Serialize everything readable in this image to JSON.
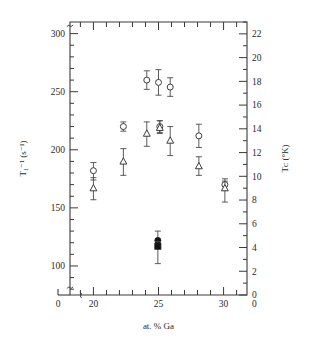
{
  "figure": {
    "background": "#ffffff",
    "ink": "#2a2a2a"
  },
  "chart_data": {
    "type": "scatter",
    "title": "",
    "subtitle": "",
    "xlabel": "at. % Ga",
    "ylabel": "T₁⁻¹ (s⁻¹)",
    "y2label": "Tᴄ (°K)",
    "grid": false,
    "legend": "none",
    "xlim": [
      18.2,
      31.8
    ],
    "ylim": [
      75,
      310
    ],
    "y2lim": [
      0,
      23
    ],
    "axis_break_x": true,
    "axis_break_y": true,
    "xticks": [
      20,
      25,
      30
    ],
    "xticklabels": [
      "20",
      "25",
      "30"
    ],
    "x_origin_label": "0",
    "xminor_step": 1,
    "yticks": [
      100,
      150,
      200,
      250,
      300
    ],
    "yticklabels": [
      "100",
      "150",
      "200",
      "250",
      "300"
    ],
    "yminor_step": 10,
    "y2ticks": [
      0,
      2,
      4,
      6,
      8,
      10,
      12,
      14,
      16,
      18,
      20,
      22
    ],
    "y2ticklabels": [
      "0",
      "2",
      "4",
      "6",
      "8",
      "10",
      "12",
      "14",
      "16",
      "18",
      "20",
      "22"
    ],
    "y2_origin_label": "0",
    "y2minor_step": 1,
    "series": [
      {
        "name": "open-circle-T1inv",
        "marker": "circle",
        "fill": "open",
        "axis": "left",
        "points": [
          {
            "x": 20.0,
            "y": 182,
            "yerr_low": 8,
            "yerr_high": 7
          },
          {
            "x": 22.3,
            "y": 220,
            "yerr_low": 4,
            "yerr_high": 4
          },
          {
            "x": 24.1,
            "y": 260,
            "yerr_low": 8,
            "yerr_high": 8
          },
          {
            "x": 25.0,
            "y": 258,
            "yerr_low": 11,
            "yerr_high": 11
          },
          {
            "x": 25.1,
            "y": 220,
            "yerr_low": 5,
            "yerr_high": 5
          },
          {
            "x": 25.9,
            "y": 254,
            "yerr_low": 8,
            "yerr_high": 8
          },
          {
            "x": 28.1,
            "y": 212,
            "yerr_low": 10,
            "yerr_high": 10
          },
          {
            "x": 30.1,
            "y": 170,
            "yerr_low": 5,
            "yerr_high": 5
          }
        ]
      },
      {
        "name": "open-triangle-Tc",
        "marker": "triangle",
        "fill": "open",
        "axis": "left",
        "points": [
          {
            "x": 20.0,
            "y": 167,
            "yerr_low": 10,
            "yerr_high": 9
          },
          {
            "x": 22.3,
            "y": 190,
            "yerr_low": 12,
            "yerr_high": 11
          },
          {
            "x": 24.1,
            "y": 214,
            "yerr_low": 11,
            "yerr_high": 10
          },
          {
            "x": 25.1,
            "y": 219,
            "yerr_low": 5,
            "yerr_high": 6
          },
          {
            "x": 25.9,
            "y": 208,
            "yerr_low": 13,
            "yerr_high": 12
          },
          {
            "x": 28.1,
            "y": 186,
            "yerr_low": 8,
            "yerr_high": 8
          },
          {
            "x": 30.1,
            "y": 167,
            "yerr_low": 12,
            "yerr_high": 6
          }
        ]
      },
      {
        "name": "filled-markers",
        "marker": "mixed",
        "fill": "solid",
        "axis": "left",
        "points": [
          {
            "x": 24.95,
            "y": 122,
            "yerr_low": 6,
            "yerr_high": 8,
            "shape": "circle"
          },
          {
            "x": 24.95,
            "y": 117,
            "yerr_low": 15,
            "yerr_high": 4,
            "shape": "square"
          }
        ]
      }
    ]
  }
}
